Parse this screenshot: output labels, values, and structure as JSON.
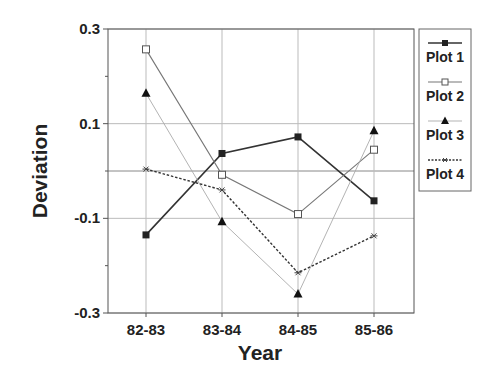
{
  "chart_data": {
    "type": "line",
    "title": "",
    "xlabel": "Year",
    "ylabel": "Deviation",
    "categories": [
      "82-83",
      "83-84",
      "84-85",
      "85-86"
    ],
    "ylim": [
      -0.3,
      0.3
    ],
    "yticks": [
      {
        "value": 0.3,
        "label": "0.3"
      },
      {
        "value": 0.1,
        "label": "0.1"
      },
      {
        "value": -0.1,
        "label": "-0.1"
      },
      {
        "value": -0.3,
        "label": "-0.3"
      }
    ],
    "minor_yticks": [
      0.2,
      0.0,
      -0.2
    ],
    "grid": true,
    "legend_position": "right",
    "series": [
      {
        "name": "Plot 1",
        "values": [
          -0.135,
          0.037,
          0.072,
          -0.063
        ],
        "marker": "filled-square",
        "line": "solid",
        "color": "#333333",
        "width": 1.6
      },
      {
        "name": "Plot 2",
        "values": [
          0.257,
          -0.008,
          -0.091,
          0.045
        ],
        "marker": "open-square",
        "line": "solid",
        "color": "#777777",
        "width": 1.1
      },
      {
        "name": "Plot 3",
        "values": [
          0.164,
          -0.107,
          -0.26,
          0.085
        ],
        "marker": "filled-triangle",
        "line": "solid",
        "color": "#aaaaaa",
        "width": 0.9
      },
      {
        "name": "Plot 4",
        "values": [
          0.004,
          -0.04,
          -0.215,
          -0.137
        ],
        "marker": "asterisk",
        "line": "dotted",
        "color": "#333333",
        "width": 1.4
      }
    ]
  }
}
